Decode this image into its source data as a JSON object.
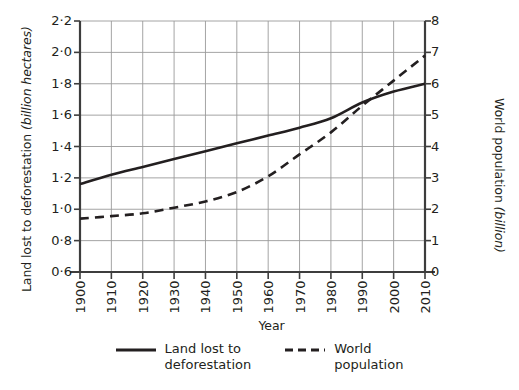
{
  "chart_data": {
    "type": "line",
    "title": "",
    "xlabel": "Year",
    "ylabel": "Land lost to deforestation (billion hectares)",
    "ylabel_plain": "Land lost to deforestation",
    "ylabel_italic": "(billion hectares)",
    "ylabel_right": "World population (billion)",
    "ylabel_right_plain": "World population",
    "ylabel_right_italic": "(billion)",
    "grid": true,
    "legend_position": "bottom-center",
    "x": [
      1900,
      1910,
      1920,
      1930,
      1940,
      1950,
      1960,
      1970,
      1980,
      1990,
      2000,
      2010
    ],
    "xtick_labels": [
      "1900",
      "1910",
      "1920",
      "1930",
      "1940",
      "1950",
      "1960",
      "1970",
      "1980",
      "1990",
      "2000",
      "2010"
    ],
    "xlim": [
      1900,
      2010
    ],
    "ylim": [
      0.6,
      2.2
    ],
    "ytick_labels": [
      "2·2",
      "2·0",
      "1·8",
      "1·6",
      "1·4",
      "1·2",
      "1·0",
      "0·8",
      "0·6"
    ],
    "yticks": [
      2.2,
      2.0,
      1.8,
      1.6,
      1.4,
      1.2,
      1.0,
      0.8,
      0.6
    ],
    "ylim_right": [
      0,
      8
    ],
    "ytick_labels_right": [
      "8",
      "7",
      "6",
      "5",
      "4",
      "3",
      "2",
      "1",
      "0"
    ],
    "yticks_right": [
      8,
      7,
      6,
      5,
      4,
      3,
      2,
      1,
      0
    ],
    "series": [
      {
        "name": "Land lost to deforestation",
        "axis": "left",
        "style": "solid",
        "color": "#231f20",
        "values": [
          1.16,
          1.22,
          1.27,
          1.32,
          1.37,
          1.42,
          1.47,
          1.52,
          1.58,
          1.68,
          1.75,
          1.8
        ]
      },
      {
        "name": "World population",
        "axis": "right",
        "style": "dashed",
        "color": "#231f20",
        "values": [
          1.7,
          1.78,
          1.87,
          2.05,
          2.25,
          2.55,
          3.05,
          3.75,
          4.45,
          5.3,
          6.1,
          6.9
        ]
      }
    ]
  },
  "legend": {
    "entries": [
      {
        "label": "Land lost to\ndeforestation",
        "style": "solid"
      },
      {
        "label": "World\npopulation",
        "style": "dashed"
      }
    ]
  },
  "colors": {
    "ink": "#231f20",
    "grid": "#9a9a9a",
    "axis": "#3d3d3d",
    "background": "#ffffff"
  }
}
